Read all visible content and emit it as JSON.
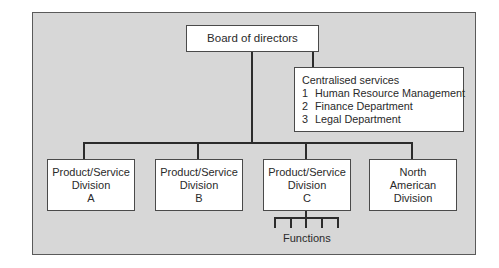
{
  "diagram": {
    "type": "organisation-chart",
    "board": {
      "label": "Board of directors"
    },
    "centralised_services": {
      "title": "Centralised services",
      "items": [
        {
          "num": "1",
          "label": "Human Resource Management"
        },
        {
          "num": "2",
          "label": "Finance Department"
        },
        {
          "num": "3",
          "label": "Legal Department"
        }
      ]
    },
    "divisions": [
      {
        "line1": "Product/Service",
        "line2": "Division",
        "line3": "A"
      },
      {
        "line1": "Product/Service",
        "line2": "Division",
        "line3": "B"
      },
      {
        "line1": "Product/Service",
        "line2": "Division",
        "line3": "C"
      },
      {
        "line1": "North",
        "line2": "American",
        "line3": "Division"
      }
    ],
    "functions": {
      "label": "Functions",
      "branch_count": 5
    },
    "colors": {
      "frame_background": "#d7d7d7",
      "box_background": "#ffffff",
      "line": "#2c2c2c"
    }
  }
}
